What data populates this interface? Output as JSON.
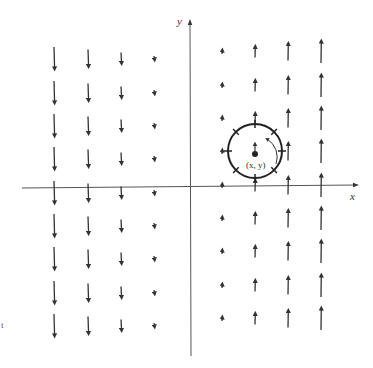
{
  "diagram": {
    "type": "vector-field",
    "axes": {
      "x_label": "x",
      "y_label": "y"
    },
    "point_label": "(x, y)",
    "margin_mark": "t",
    "colors": {
      "ink": "#333333",
      "background": "#ffffff"
    },
    "columns": [
      {
        "x_px": 54,
        "direction": "down",
        "length": 22
      },
      {
        "x_px": 88,
        "direction": "down",
        "length": 17
      },
      {
        "x_px": 121,
        "direction": "down",
        "length": 11
      },
      {
        "x_px": 154,
        "direction": "down",
        "length": 4
      },
      {
        "x_px": 222,
        "direction": "up",
        "length": 4
      },
      {
        "x_px": 255,
        "direction": "up",
        "length": 11
      },
      {
        "x_px": 288,
        "direction": "up",
        "length": 17
      },
      {
        "x_px": 321,
        "direction": "up",
        "length": 22
      }
    ],
    "rows_px": [
      58,
      92,
      125,
      158,
      192,
      225,
      258,
      292,
      325
    ],
    "paddle_wheel": {
      "cx": 255,
      "cy": 151,
      "r": 27,
      "rotation": "counterclockwise"
    }
  }
}
